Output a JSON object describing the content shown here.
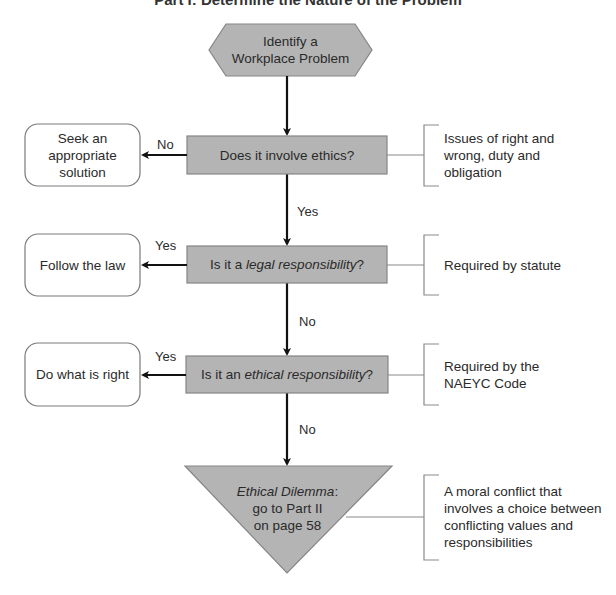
{
  "title": "Part I: Determine the Nature of the Problem",
  "colors": {
    "shape_fill": "#b4b4b4",
    "shape_border": "#858585",
    "arrow": "#111111",
    "connector": "#8a8a8a",
    "outcome_border": "#7a7a7a"
  },
  "start": {
    "line1": "Identify a",
    "line2": "Workplace Problem"
  },
  "decisions": [
    {
      "question_pre": "Does it involve ethics?",
      "question_em": "",
      "question_post": "",
      "side_branch_label": "No",
      "outcome_lines": [
        "Seek an",
        "appropriate",
        "solution"
      ],
      "note_lines": [
        "Issues of right and",
        "wrong, duty and",
        "obligation"
      ],
      "down_label": "Yes"
    },
    {
      "question_pre": "Is it a ",
      "question_em": "legal responsibility",
      "question_post": "?",
      "side_branch_label": "Yes",
      "outcome_lines": [
        "Follow the law"
      ],
      "note_lines": [
        "Required by statute"
      ],
      "down_label": "No"
    },
    {
      "question_pre": "Is it an ",
      "question_em": "ethical responsibility",
      "question_post": "?",
      "side_branch_label": "Yes",
      "outcome_lines": [
        "Do what is right"
      ],
      "note_lines": [
        "Required by the",
        "NAEYC Code"
      ],
      "down_label": "No"
    }
  ],
  "end": {
    "line1_em": "Ethical Dilemma",
    "line1_post": ":",
    "line2": "go to Part II",
    "line3": "on page 58",
    "note_lines": [
      "A moral conflict that",
      "involves a choice between",
      "conflicting values and",
      "responsibilities"
    ]
  }
}
